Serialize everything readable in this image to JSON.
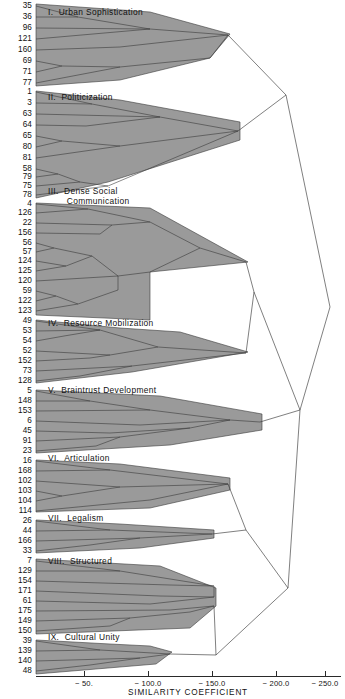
{
  "figure": {
    "kind": "dendrogram",
    "background_color": "#ffffff",
    "polygon_fill_color": "#9a9a9a",
    "line_color": "#3a3a3a",
    "width": 345,
    "height": 699
  },
  "axis": {
    "title": "SIMILARITY COEFFICIENT",
    "ticks": [
      {
        "label": "− 50.",
        "value": -50,
        "x": 84
      },
      {
        "label": "− 100.0",
        "value": -100,
        "x": 148
      },
      {
        "label": "− 150.0",
        "value": -150,
        "x": 212
      },
      {
        "label": "− 200.0",
        "value": -200,
        "x": 276
      },
      {
        "label": "− 250.0",
        "value": -250,
        "x": 325
      }
    ],
    "baseline_y": 676,
    "title_y": 688
  },
  "clusters": [
    {
      "roman": "I.",
      "name": "Urban Sophistication",
      "title": "I.  Urban Sophistication",
      "title_x": 48,
      "title_y": 7,
      "leaves": [
        35,
        36,
        96,
        121,
        160,
        69,
        71,
        77
      ]
    },
    {
      "roman": "II.",
      "name": "Politicization",
      "title": "II.  Politicization",
      "title_x": 48,
      "title_y": 92,
      "leaves": [
        1,
        3,
        63,
        64,
        65,
        80,
        81,
        58,
        79,
        75,
        78
      ]
    },
    {
      "roman": "III.",
      "name": "Dense Social Communication",
      "title": "III.  Dense Social\n       Communication",
      "title_x": 48,
      "title_y": 186,
      "leaves": [
        4,
        126,
        22,
        156,
        56,
        57,
        124,
        125,
        120,
        59,
        122,
        123
      ]
    },
    {
      "roman": "IV.",
      "name": "Resource Mobilization",
      "title": "IV.  Resource Mobilization",
      "title_x": 48,
      "title_y": 318,
      "leaves": [
        49,
        53,
        54,
        52,
        152,
        73,
        128
      ]
    },
    {
      "roman": "V.",
      "name": "Braintrust Development",
      "title": "V.  Braintrust Development",
      "title_x": 48,
      "title_y": 385,
      "leaves": [
        5,
        148,
        153,
        6,
        45,
        91,
        23
      ]
    },
    {
      "roman": "VI.",
      "name": "Articulation",
      "title": "VI.  Articulation",
      "title_x": 48,
      "title_y": 453,
      "leaves": [
        16,
        168,
        102,
        103,
        104,
        114
      ]
    },
    {
      "roman": "VII.",
      "name": "Legalism",
      "title": "VII.  Legalism",
      "title_x": 48,
      "title_y": 513,
      "leaves": [
        26,
        44,
        166,
        33
      ]
    },
    {
      "roman": "VIII.",
      "name": "Structured",
      "title": "VIII.  Structured",
      "title_x": 48,
      "title_y": 556,
      "leaves": [
        7,
        129,
        154,
        171,
        61,
        175,
        149,
        150
      ]
    },
    {
      "roman": "IX.",
      "name": "Cultural Unity",
      "title": "IX.  Cultural Unity",
      "title_x": 48,
      "title_y": 632,
      "leaves": [
        39,
        139,
        140,
        48
      ]
    }
  ],
  "leaf_rows": [
    {
      "label": "35",
      "y": 6
    },
    {
      "label": "36",
      "y": 17
    },
    {
      "label": "96",
      "y": 28
    },
    {
      "label": "121",
      "y": 39
    },
    {
      "label": "160",
      "y": 50
    },
    {
      "label": "69",
      "y": 61
    },
    {
      "label": "71",
      "y": 72
    },
    {
      "label": "77",
      "y": 83
    },
    {
      "label": "1",
      "y": 92
    },
    {
      "label": "3",
      "y": 103
    },
    {
      "label": "63",
      "y": 114
    },
    {
      "label": "64",
      "y": 125
    },
    {
      "label": "65",
      "y": 136
    },
    {
      "label": "80",
      "y": 147
    },
    {
      "label": "81",
      "y": 158
    },
    {
      "label": "58",
      "y": 169
    },
    {
      "label": "79",
      "y": 177
    },
    {
      "label": "75",
      "y": 186
    },
    {
      "label": "78",
      "y": 195
    },
    {
      "label": "4",
      "y": 204
    },
    {
      "label": "126",
      "y": 213
    },
    {
      "label": "22",
      "y": 223
    },
    {
      "label": "156",
      "y": 233
    },
    {
      "label": "56",
      "y": 243
    },
    {
      "label": "57",
      "y": 252
    },
    {
      "label": "124",
      "y": 261
    },
    {
      "label": "125",
      "y": 271
    },
    {
      "label": "120",
      "y": 281
    },
    {
      "label": "59",
      "y": 291
    },
    {
      "label": "122",
      "y": 301
    },
    {
      "label": "123",
      "y": 311
    },
    {
      "label": "49",
      "y": 321
    },
    {
      "label": "53",
      "y": 331
    },
    {
      "label": "54",
      "y": 341
    },
    {
      "label": "52",
      "y": 351
    },
    {
      "label": "152",
      "y": 361
    },
    {
      "label": "73",
      "y": 371
    },
    {
      "label": "128",
      "y": 381
    },
    {
      "label": "5",
      "y": 391
    },
    {
      "label": "148",
      "y": 401
    },
    {
      "label": "153",
      "y": 411
    },
    {
      "label": "6",
      "y": 421
    },
    {
      "label": "45",
      "y": 431
    },
    {
      "label": "91",
      "y": 441
    },
    {
      "label": "23",
      "y": 451
    },
    {
      "label": "16",
      "y": 461
    },
    {
      "label": "168",
      "y": 471
    },
    {
      "label": "102",
      "y": 481
    },
    {
      "label": "103",
      "y": 491
    },
    {
      "label": "104",
      "y": 501
    },
    {
      "label": "114",
      "y": 511
    },
    {
      "label": "26",
      "y": 521
    },
    {
      "label": "44",
      "y": 531
    },
    {
      "label": "166",
      "y": 541
    },
    {
      "label": "33",
      "y": 551
    },
    {
      "label": "7",
      "y": 561
    },
    {
      "label": "129",
      "y": 571
    },
    {
      "label": "154",
      "y": 581
    },
    {
      "label": "171",
      "y": 591
    },
    {
      "label": "61",
      "y": 601
    },
    {
      "label": "175",
      "y": 611
    },
    {
      "label": "149",
      "y": 621
    },
    {
      "label": "150",
      "y": 631
    },
    {
      "label": "39",
      "y": 641
    },
    {
      "label": "139",
      "y": 651
    },
    {
      "label": "140",
      "y": 661
    },
    {
      "label": "48",
      "y": 671
    }
  ],
  "chart_data": {
    "type": "table",
    "title": "",
    "xlabel": "SIMILARITY COEFFICIENT",
    "ylabel": "",
    "xlim": [
      0,
      -265
    ],
    "xticks": [
      -50,
      -100,
      -150,
      -200,
      -250
    ],
    "grid": false,
    "legend": "none",
    "orientation": "horizontal",
    "categories": [
      "I. Urban Sophistication",
      "II. Politicization",
      "III. Dense Social Communication",
      "IV. Resource Mobilization",
      "V. Braintrust Development",
      "VI. Articulation",
      "VII. Legalism",
      "VIII. Structured",
      "IX. Cultural Unity"
    ],
    "cluster_leaf_counts": [
      8,
      11,
      12,
      7,
      7,
      6,
      4,
      8,
      4
    ],
    "cluster_leaves": [
      [
        35,
        36,
        96,
        121,
        160,
        69,
        71,
        77
      ],
      [
        1,
        3,
        63,
        64,
        65,
        80,
        81,
        58,
        79,
        75,
        78
      ],
      [
        4,
        126,
        22,
        156,
        56,
        57,
        124,
        125,
        120,
        59,
        122,
        123
      ],
      [
        49,
        53,
        54,
        52,
        152,
        73,
        128
      ],
      [
        5,
        148,
        153,
        6,
        45,
        91,
        23
      ],
      [
        16,
        168,
        102,
        103,
        104,
        114
      ],
      [
        26,
        44,
        166,
        33
      ],
      [
        7,
        129,
        154,
        171,
        61,
        175,
        149,
        150
      ],
      [
        39,
        139,
        140,
        48
      ]
    ],
    "cluster_fusion_similarity": [
      -150,
      -160,
      -170,
      -130,
      -175,
      -160,
      -140,
      -165,
      -115
    ],
    "merge_events": [
      {
        "merge": [
          "I",
          "II"
        ],
        "similarity": -200
      },
      {
        "merge": [
          "III",
          "IV"
        ],
        "similarity": -175
      },
      {
        "merge": [
          "III+IV",
          "V"
        ],
        "similarity": -215
      },
      {
        "merge": [
          "VI",
          "VII"
        ],
        "similarity": -180
      },
      {
        "merge": [
          "VIII",
          "IX"
        ],
        "similarity": -170
      },
      {
        "merge": [
          "VI+VII",
          "VIII+IX"
        ],
        "similarity": -205
      },
      {
        "merge": [
          "III+IV+V",
          "VI+VII+VIII+IX"
        ],
        "similarity": -235
      },
      {
        "merge": [
          "I+II",
          "rest"
        ],
        "similarity": -252
      }
    ]
  }
}
